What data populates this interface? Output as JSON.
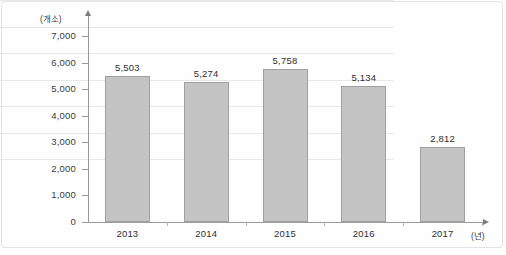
{
  "chart_data": {
    "type": "bar",
    "title": "",
    "xlabel": "(년)",
    "ylabel": "(개소)",
    "categories": [
      "2013",
      "2014",
      "2015",
      "2016",
      "2017"
    ],
    "values": [
      5503,
      5274,
      5758,
      5134,
      2812
    ],
    "value_labels": [
      "5,503",
      "5,274",
      "5,758",
      "5,134",
      "2,812"
    ],
    "ylim": [
      0,
      7000
    ],
    "ytick_values": [
      7000,
      6000,
      5000,
      4000,
      3000,
      2000,
      1000,
      0
    ],
    "ytick_labels": [
      "7,000",
      "6,000",
      "5,000",
      "4,000",
      "3,000",
      "2,000",
      "1,000",
      "0"
    ],
    "grid": true,
    "legend": "none",
    "series": [
      {
        "name": "개소",
        "values": [
          5503,
          5274,
          5758,
          5134,
          2812
        ]
      }
    ],
    "colors": {
      "bar_fill": "#c4c4c4",
      "bar_border": "#a0a0a0",
      "gridline": "#e8e8e8",
      "axis": "#9a9a9a",
      "text": "#2e2e2e",
      "frame": "#e3e3e3"
    }
  }
}
